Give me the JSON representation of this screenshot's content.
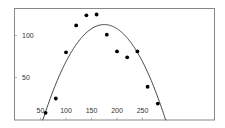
{
  "chart_data": {
    "type": "scatter",
    "title": "",
    "xlabel": "",
    "ylabel": "",
    "xlim": [
      0,
      390
    ],
    "ylim": [
      0,
      133
    ],
    "grid": false,
    "legend": null,
    "x_ticks": [
      50,
      100,
      150,
      200,
      250
    ],
    "y_ticks": [
      50,
      100
    ],
    "x_tick_labels": [
      "50",
      "100",
      "150",
      "200",
      "250"
    ],
    "y_tick_labels": [
      "50",
      "100"
    ],
    "series": [
      {
        "name": "observations",
        "kind": "scatter",
        "x": [
          60,
          80,
          100,
          120,
          140,
          160,
          180,
          200,
          220,
          240,
          260,
          280
        ],
        "y": [
          8,
          25,
          80,
          112,
          124,
          125,
          101,
          81,
          74,
          81,
          39,
          19
        ]
      },
      {
        "name": "quadratic fit",
        "kind": "line",
        "peak": [
          175,
          113
        ],
        "roots": [
          55,
          295
        ]
      }
    ],
    "colors": {
      "points": "#000000",
      "curve": "#333333",
      "frame": "#888888"
    }
  }
}
